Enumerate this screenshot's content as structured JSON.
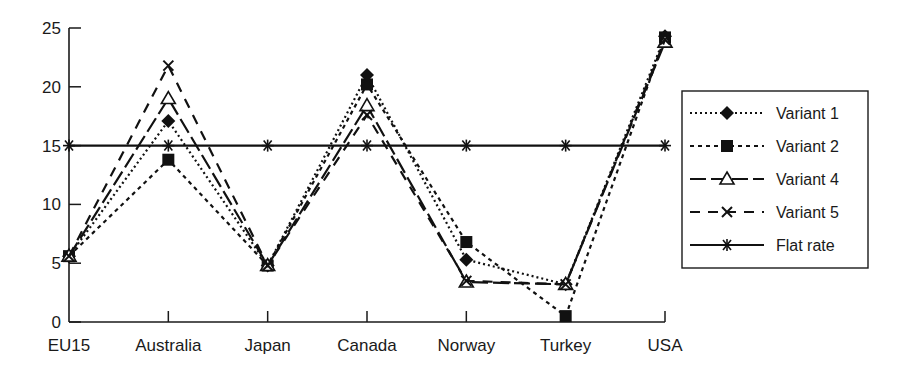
{
  "chart_data": {
    "type": "line",
    "title": "",
    "xlabel": "",
    "ylabel": "",
    "ylim": [
      0,
      25
    ],
    "yticks": [
      0,
      5,
      10,
      15,
      20,
      25
    ],
    "grid": false,
    "legend_position": "right",
    "categories": [
      "EU15",
      "Australia",
      "Japan",
      "Canada",
      "Norway",
      "Turkey",
      "USA"
    ],
    "series": [
      {
        "name": "Variant 1",
        "marker": "diamond-filled",
        "line": "dotted",
        "values": [
          5.6,
          17.1,
          4.8,
          21.0,
          5.3,
          3.2,
          24.3
        ]
      },
      {
        "name": "Variant 2",
        "marker": "square-filled",
        "line": "short-dash",
        "values": [
          5.6,
          13.8,
          4.8,
          20.2,
          6.8,
          0.5,
          24.2
        ]
      },
      {
        "name": "Variant 4",
        "marker": "triangle-open",
        "line": "long-dash",
        "values": [
          5.6,
          19.0,
          4.8,
          18.4,
          3.4,
          3.2,
          23.8
        ]
      },
      {
        "name": "Variant 5",
        "marker": "x",
        "line": "dash",
        "values": [
          5.6,
          21.8,
          4.8,
          17.6,
          3.5,
          3.2,
          24.0
        ]
      },
      {
        "name": "Flat rate",
        "marker": "asterisk",
        "line": "solid",
        "values": [
          15,
          15,
          15,
          15,
          15,
          15,
          15
        ]
      }
    ]
  }
}
